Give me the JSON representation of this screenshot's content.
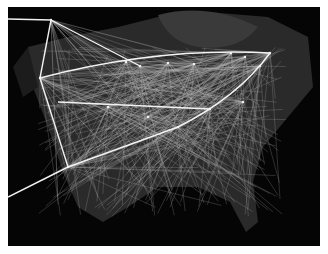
{
  "figure": {
    "background": "#ffffff",
    "map_background": "#050505",
    "land_color": "#2a2a2a",
    "edge_color": "#bdbdbd",
    "highlight_color": "#f2f2f2"
  },
  "hubs": [
    {
      "id": "h1",
      "x": 43,
      "y": 13
    },
    {
      "id": "h2",
      "x": 32,
      "y": 71
    },
    {
      "id": "h3",
      "x": 118,
      "y": 55
    },
    {
      "id": "h4",
      "x": 132,
      "y": 59
    },
    {
      "id": "h5",
      "x": 160,
      "y": 56
    },
    {
      "id": "h6",
      "x": 186,
      "y": 57
    },
    {
      "id": "h7",
      "x": 223,
      "y": 46
    },
    {
      "id": "h8",
      "x": 237,
      "y": 50
    },
    {
      "id": "h9",
      "x": 262,
      "y": 46
    },
    {
      "id": "h10",
      "x": 252,
      "y": 59
    },
    {
      "id": "h11",
      "x": 170,
      "y": 120
    },
    {
      "id": "h12",
      "x": 235,
      "y": 95
    },
    {
      "id": "h13",
      "x": 60,
      "y": 160
    },
    {
      "id": "h14",
      "x": 202,
      "y": 102
    },
    {
      "id": "h15",
      "x": 100,
      "y": 100
    },
    {
      "id": "h16",
      "x": 140,
      "y": 110
    }
  ],
  "highlight_arcs": [
    "M32,71 Q150,40 262,46",
    "M43,13 L132,59",
    "M43,13 L32,71",
    "M0,12 L43,13",
    "M60,160 L0,190",
    "M32,71 L60,160",
    "M170,120 Q230,90 262,46",
    "M170,120 L60,160",
    "M50,95 L202,102"
  ]
}
